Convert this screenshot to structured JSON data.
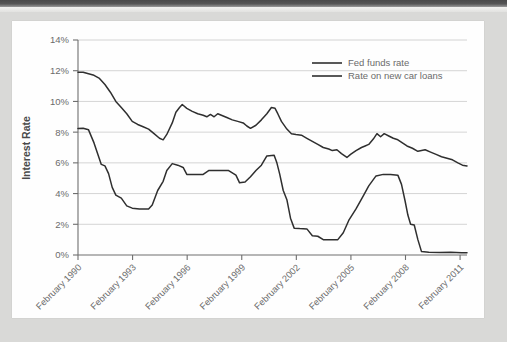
{
  "chart_data": {
    "type": "line",
    "title": "",
    "xlabel": "",
    "ylabel": "Interest Rate",
    "ylim": [
      0,
      14
    ],
    "ytick_labels": [
      "0%",
      "2%",
      "4%",
      "6%",
      "8%",
      "10%",
      "12%",
      "14%"
    ],
    "ytick_values": [
      0,
      2,
      4,
      6,
      8,
      10,
      12,
      14
    ],
    "xtick_labels": [
      "February 1990",
      "February 1993",
      "February 1996",
      "February 1999",
      "February 2002",
      "February 2005",
      "February 2008",
      "February 2011"
    ],
    "xtick_values": [
      1990.12,
      1993.12,
      1996.12,
      1999.12,
      2002.12,
      2005.12,
      2008.12,
      2011.12
    ],
    "xlim": [
      1990.12,
      2011.5
    ],
    "grid": "horizontal",
    "legend_position": "top-right",
    "legend": [
      "Fed funds rate",
      "Rate on new car loans"
    ],
    "series": [
      {
        "name": "Fed funds rate",
        "color": "#2f2f2f",
        "points": [
          [
            1990.12,
            8.24
          ],
          [
            1990.4,
            8.25
          ],
          [
            1990.7,
            8.15
          ],
          [
            1991.0,
            7.3
          ],
          [
            1991.2,
            6.6
          ],
          [
            1991.4,
            5.9
          ],
          [
            1991.6,
            5.8
          ],
          [
            1991.8,
            5.3
          ],
          [
            1992.0,
            4.4
          ],
          [
            1992.2,
            3.9
          ],
          [
            1992.5,
            3.7
          ],
          [
            1992.8,
            3.2
          ],
          [
            1993.1,
            3.05
          ],
          [
            1993.5,
            3.0
          ],
          [
            1994.0,
            3.0
          ],
          [
            1994.2,
            3.25
          ],
          [
            1994.5,
            4.2
          ],
          [
            1994.8,
            4.8
          ],
          [
            1995.0,
            5.5
          ],
          [
            1995.3,
            5.95
          ],
          [
            1995.6,
            5.85
          ],
          [
            1995.9,
            5.7
          ],
          [
            1996.1,
            5.25
          ],
          [
            1996.5,
            5.25
          ],
          [
            1997.0,
            5.25
          ],
          [
            1997.3,
            5.5
          ],
          [
            1997.8,
            5.5
          ],
          [
            1998.4,
            5.5
          ],
          [
            1998.8,
            5.2
          ],
          [
            1999.0,
            4.7
          ],
          [
            1999.3,
            4.75
          ],
          [
            1999.6,
            5.1
          ],
          [
            1999.9,
            5.5
          ],
          [
            2000.2,
            5.85
          ],
          [
            2000.5,
            6.45
          ],
          [
            2000.9,
            6.5
          ],
          [
            2001.05,
            6.0
          ],
          [
            2001.2,
            5.3
          ],
          [
            2001.4,
            4.2
          ],
          [
            2001.6,
            3.6
          ],
          [
            2001.8,
            2.4
          ],
          [
            2002.0,
            1.75
          ],
          [
            2002.3,
            1.72
          ],
          [
            2002.7,
            1.7
          ],
          [
            2003.0,
            1.25
          ],
          [
            2003.3,
            1.22
          ],
          [
            2003.6,
            1.0
          ],
          [
            2004.0,
            1.0
          ],
          [
            2004.4,
            1.0
          ],
          [
            2004.7,
            1.45
          ],
          [
            2005.0,
            2.25
          ],
          [
            2005.4,
            3.0
          ],
          [
            2005.8,
            3.85
          ],
          [
            2006.1,
            4.5
          ],
          [
            2006.5,
            5.15
          ],
          [
            2006.9,
            5.25
          ],
          [
            2007.3,
            5.25
          ],
          [
            2007.7,
            5.2
          ],
          [
            2007.9,
            4.6
          ],
          [
            2008.1,
            3.5
          ],
          [
            2008.25,
            2.6
          ],
          [
            2008.4,
            2.0
          ],
          [
            2008.6,
            1.95
          ],
          [
            2008.8,
            1.0
          ],
          [
            2009.0,
            0.22
          ],
          [
            2009.4,
            0.18
          ],
          [
            2010.0,
            0.16
          ],
          [
            2010.6,
            0.18
          ],
          [
            2011.2,
            0.15
          ],
          [
            2011.5,
            0.15
          ]
        ]
      },
      {
        "name": "Rate on new car loans",
        "color": "#2f2f2f",
        "points": [
          [
            1990.12,
            11.9
          ],
          [
            1990.4,
            11.9
          ],
          [
            1990.7,
            11.8
          ],
          [
            1991.0,
            11.7
          ],
          [
            1991.3,
            11.5
          ],
          [
            1991.6,
            11.1
          ],
          [
            1991.9,
            10.6
          ],
          [
            1992.2,
            10.0
          ],
          [
            1992.5,
            9.6
          ],
          [
            1992.8,
            9.2
          ],
          [
            1993.1,
            8.7
          ],
          [
            1993.4,
            8.5
          ],
          [
            1993.7,
            8.35
          ],
          [
            1994.0,
            8.2
          ],
          [
            1994.3,
            7.9
          ],
          [
            1994.6,
            7.6
          ],
          [
            1994.8,
            7.5
          ],
          [
            1995.0,
            7.85
          ],
          [
            1995.3,
            8.6
          ],
          [
            1995.5,
            9.3
          ],
          [
            1995.7,
            9.6
          ],
          [
            1995.85,
            9.8
          ],
          [
            1996.1,
            9.55
          ],
          [
            1996.4,
            9.35
          ],
          [
            1996.7,
            9.2
          ],
          [
            1997.0,
            9.1
          ],
          [
            1997.2,
            9.0
          ],
          [
            1997.4,
            9.15
          ],
          [
            1997.6,
            9.0
          ],
          [
            1997.8,
            9.2
          ],
          [
            1998.0,
            9.1
          ],
          [
            1998.3,
            8.95
          ],
          [
            1998.6,
            8.8
          ],
          [
            1998.9,
            8.7
          ],
          [
            1999.2,
            8.6
          ],
          [
            1999.4,
            8.4
          ],
          [
            1999.6,
            8.25
          ],
          [
            1999.9,
            8.45
          ],
          [
            2000.2,
            8.8
          ],
          [
            2000.5,
            9.2
          ],
          [
            2000.75,
            9.6
          ],
          [
            2000.95,
            9.55
          ],
          [
            2001.1,
            9.2
          ],
          [
            2001.3,
            8.7
          ],
          [
            2001.6,
            8.2
          ],
          [
            2001.85,
            7.9
          ],
          [
            2002.1,
            7.85
          ],
          [
            2002.4,
            7.8
          ],
          [
            2002.7,
            7.6
          ],
          [
            2003.0,
            7.4
          ],
          [
            2003.3,
            7.2
          ],
          [
            2003.6,
            7.0
          ],
          [
            2003.9,
            6.9
          ],
          [
            2004.1,
            6.8
          ],
          [
            2004.35,
            6.85
          ],
          [
            2004.6,
            6.6
          ],
          [
            2004.9,
            6.35
          ],
          [
            2005.1,
            6.55
          ],
          [
            2005.4,
            6.8
          ],
          [
            2005.7,
            7.0
          ],
          [
            2005.9,
            7.1
          ],
          [
            2006.1,
            7.2
          ],
          [
            2006.35,
            7.55
          ],
          [
            2006.55,
            7.9
          ],
          [
            2006.75,
            7.7
          ],
          [
            2006.95,
            7.9
          ],
          [
            2007.2,
            7.75
          ],
          [
            2007.45,
            7.6
          ],
          [
            2007.7,
            7.5
          ],
          [
            2007.95,
            7.3
          ],
          [
            2008.2,
            7.1
          ],
          [
            2008.5,
            6.95
          ],
          [
            2008.8,
            6.75
          ],
          [
            2009.0,
            6.8
          ],
          [
            2009.2,
            6.85
          ],
          [
            2009.5,
            6.7
          ],
          [
            2009.8,
            6.55
          ],
          [
            2010.1,
            6.4
          ],
          [
            2010.4,
            6.3
          ],
          [
            2010.7,
            6.2
          ],
          [
            2011.0,
            6.0
          ],
          [
            2011.25,
            5.85
          ],
          [
            2011.5,
            5.8
          ]
        ]
      }
    ]
  }
}
